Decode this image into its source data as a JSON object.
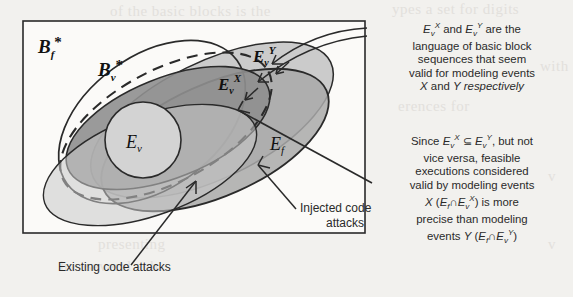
{
  "figure": {
    "type": "venn-ellipse-diagram",
    "box": {
      "label": "outer-universe-box"
    },
    "regions": [
      {
        "name": "Bf-star",
        "label": "B_f*",
        "style": "solid-outline, unfilled"
      },
      {
        "name": "Bv-star",
        "label": "B_v*",
        "style": "dashed-outline"
      },
      {
        "name": "Ev-Y",
        "label": "E_v^Y",
        "style": "light-gray-fill"
      },
      {
        "name": "Ev-X",
        "label": "E_v^X",
        "style": "medium-gray-fill"
      },
      {
        "name": "Ef",
        "label": "E_f",
        "style": "medium-gray-fill"
      },
      {
        "name": "Ev",
        "label": "E_v",
        "style": "pale-gray-fill"
      }
    ],
    "labels": {
      "bf_star_base": "B",
      "bf_star_sub": "f",
      "bf_star_sup": "*",
      "bv_star_base": "B",
      "bv_star_sub": "v",
      "bv_star_sup": "*",
      "evy_base": "E",
      "evy_sub": "v",
      "evy_sup": "Y",
      "evx_base": "E",
      "evx_sub": "v",
      "evx_sup": "X",
      "ev_base": "E",
      "ev_sub": "v",
      "ef_base": "E",
      "ef_sub": "f"
    },
    "callouts": [
      {
        "name": "injected-code-attacks",
        "line1": "Injected code",
        "line2": "attacks"
      },
      {
        "name": "existing-code-attacks",
        "line1": "Existing code attacks"
      }
    ]
  },
  "annotations": {
    "top": {
      "name": "ev-language-note",
      "lines": [
        "E_v^X and E_v^Y are the",
        "language of basic block",
        "sequences that seem",
        "valid for modeling events",
        "X and Y respectively"
      ],
      "plain": "Ev^X and Ev^Y are the language of basic block sequences that seem valid for modeling events X and Y respectively"
    },
    "bottom": {
      "name": "precision-note",
      "lines": [
        "Since E_v^X ⊆ E_v^Y, but not",
        "vice versa, feasible",
        "executions considered",
        "valid by modeling events",
        "X (E_f∩E_v^X) is more",
        "precise than modeling",
        "events Y (E_f∩E_v^Y)"
      ],
      "plain": "Since Ev^X ⊆ Ev^Y, but not vice versa, feasible executions considered valid by modeling events X (Ef∩Ev^X) is more precise than modeling events Y (Ef∩Ev^Y)"
    }
  },
  "ghost_text": {
    "g1": "ypes a set for digits",
    "g2": "of the basic blocks is the",
    "g3": "with",
    "g4": "erences for",
    "g5": "UNBI",
    "g6": "v",
    "g7": "presenting",
    "g8": "has several sub",
    "g9": "v"
  },
  "colors": {
    "background": "#f2f1ee",
    "ink": "#2a2a2a",
    "fill_light": "#c9c9c9",
    "fill_medium": "#a8a8a8",
    "fill_dark": "#8f8f8f",
    "fill_pale": "#cfcfcf"
  }
}
